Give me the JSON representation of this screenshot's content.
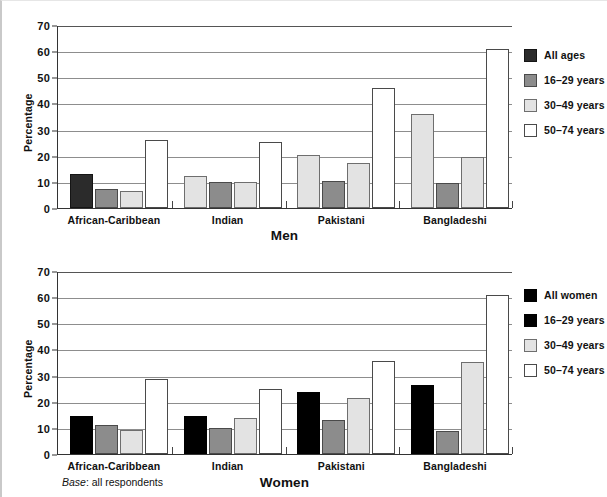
{
  "header": {
    "cutoff_text": ""
  },
  "footnote": {
    "label": "Base",
    "separator": ": ",
    "text": "all respondents"
  },
  "charts": [
    {
      "id": "men",
      "axis_title": "Men",
      "ylabel": "Percentage",
      "legend": [
        "All ages",
        "16–29 years",
        "30–49 years",
        "50–74 years"
      ],
      "legend_styles": [
        "s0",
        "s1",
        "s2",
        "s3"
      ],
      "categories": [
        "African-Caribbean",
        "Indian",
        "Pakistani",
        "Bangladeshi"
      ],
      "yticks": [
        "0",
        "10",
        "20",
        "30",
        "40",
        "50",
        "60",
        "70"
      ]
    },
    {
      "id": "women",
      "axis_title": "Women",
      "ylabel": "Percentage",
      "legend": [
        "All women",
        "16–29 years",
        "30–49 years",
        "50–74 years"
      ],
      "legend_styles": [
        "s0 pureblack",
        "s1 pureblack",
        "s2",
        "s3"
      ],
      "categories": [
        "African-Caribbean",
        "Indian",
        "Pakistani",
        "Bangladeshi"
      ],
      "yticks": [
        "0",
        "10",
        "20",
        "30",
        "40",
        "50",
        "60",
        "70"
      ]
    }
  ],
  "chart_data": [
    {
      "type": "bar",
      "title": "Men",
      "xlabel": "Men",
      "ylabel": "Percentage",
      "ylim": [
        0,
        70
      ],
      "ytick_step": 10,
      "grid": true,
      "legend_position": "right",
      "categories": [
        "African-Caribbean",
        "Indian",
        "Pakistani",
        "Bangladeshi"
      ],
      "series": [
        {
          "name": "All ages",
          "style": "s0",
          "values": [
            13,
            null,
            null,
            null
          ]
        },
        {
          "name": "16–29 years",
          "style": "s1",
          "values": [
            7,
            12.5,
            20,
            36
          ]
        },
        {
          "name": "30–49 years",
          "style": "s2",
          "values": [
            6.5,
            10,
            10.5,
            9.5
          ]
        },
        {
          "name": "50–74 years",
          "style": "s3",
          "values": [
            26,
            25,
            17,
            19.5
          ]
        }
      ],
      "extra_bars": {
        "Indian": {
          "All ages": null
        },
        "Pakistani": {
          "All ages": null
        },
        "Bangladeshi": {
          "All ages": null
        }
      },
      "note": "Indian/Pakistani/Bangladeshi groups show an additional 50-74 years bar; raw per-group bar list given in bars_by_group"
    },
    {
      "type": "bar",
      "title": "Women",
      "xlabel": "Women",
      "ylabel": "Percentage",
      "ylim": [
        0,
        70
      ],
      "ytick_step": 10,
      "grid": true,
      "legend_position": "right",
      "categories": [
        "African-Caribbean",
        "Indian",
        "Pakistani",
        "Bangladeshi"
      ],
      "series": [
        {
          "name": "All women",
          "style": "s0",
          "values": [
            14.7,
            14.6,
            23.8,
            26.3
          ]
        },
        {
          "name": "16–29 years",
          "style": "s1",
          "values": [
            11.1,
            10.0,
            13.0,
            8.7
          ]
        },
        {
          "name": "30–49 years",
          "style": "s2",
          "values": [
            9.0,
            13.6,
            21.4,
            35.3
          ]
        },
        {
          "name": "50–74 years",
          "style": "s3",
          "values": [
            28.8,
            24.9,
            35.5,
            61.0
          ]
        }
      ]
    }
  ],
  "bars_by_group": {
    "men": [
      {
        "category": "African-Caribbean",
        "bars": [
          {
            "series": "All ages",
            "style": "s0",
            "value": 13
          },
          {
            "series": "16–29 years",
            "style": "s1",
            "value": 7.2
          },
          {
            "series": "30–49 years",
            "style": "s2",
            "value": 6.6
          },
          {
            "series": "50–74 years",
            "style": "s3",
            "value": 25.9
          }
        ]
      },
      {
        "category": "Indian",
        "bars": [
          {
            "series": "16–29 years",
            "style": "s2",
            "value": 12.4
          },
          {
            "series": "30–49 years",
            "style": "s1",
            "value": 9.8
          },
          {
            "series": "50–74 years",
            "style": "s2",
            "value": 9.8
          },
          {
            "series": "50–74 years",
            "style": "s3",
            "value": 25.1
          }
        ]
      },
      {
        "category": "Pakistani",
        "bars": [
          {
            "series": "16–29 years",
            "style": "s2",
            "value": 20.1
          },
          {
            "series": "30–49 years",
            "style": "s1",
            "value": 10.4
          },
          {
            "series": "30–49 years",
            "style": "s2",
            "value": 17.2
          },
          {
            "series": "50–74 years",
            "style": "s3",
            "value": 46.0
          }
        ]
      },
      {
        "category": "Bangladeshi",
        "bars": [
          {
            "series": "16–29 years",
            "style": "s2",
            "value": 35.9
          },
          {
            "series": "30–49 years",
            "style": "s1",
            "value": 9.6
          },
          {
            "series": "30–49 years",
            "style": "s2",
            "value": 19.5
          },
          {
            "series": "50–74 years",
            "style": "s3",
            "value": 60.8
          }
        ]
      }
    ],
    "women": [
      {
        "category": "African-Caribbean",
        "bars": [
          {
            "series": "All women",
            "style": "s0 pureblack",
            "value": 14.7
          },
          {
            "series": "16–29 years",
            "style": "s1",
            "value": 11.1
          },
          {
            "series": "30–49 years",
            "style": "s2",
            "value": 9.0
          },
          {
            "series": "50–74 years",
            "style": "s3",
            "value": 28.8
          }
        ]
      },
      {
        "category": "Indian",
        "bars": [
          {
            "series": "All women",
            "style": "s0 pureblack",
            "value": 14.6
          },
          {
            "series": "16–29 years",
            "style": "s1",
            "value": 10.0
          },
          {
            "series": "30–49 years",
            "style": "s2",
            "value": 13.6
          },
          {
            "series": "50–74 years",
            "style": "s3",
            "value": 24.9
          }
        ]
      },
      {
        "category": "Pakistani",
        "bars": [
          {
            "series": "All women",
            "style": "s0 pureblack",
            "value": 23.8
          },
          {
            "series": "16–29 years",
            "style": "s1",
            "value": 13.0
          },
          {
            "series": "30–49 years",
            "style": "s2",
            "value": 21.4
          },
          {
            "series": "50–74 years",
            "style": "s3",
            "value": 35.5
          }
        ]
      },
      {
        "category": "Bangladeshi",
        "bars": [
          {
            "series": "All women",
            "style": "s0 pureblack",
            "value": 26.3
          },
          {
            "series": "16–29 years",
            "style": "s1",
            "value": 8.7
          },
          {
            "series": "30–49 years",
            "style": "s2",
            "value": 35.3
          },
          {
            "series": "50–74 years",
            "style": "s3",
            "value": 61.0
          }
        ]
      }
    ]
  }
}
